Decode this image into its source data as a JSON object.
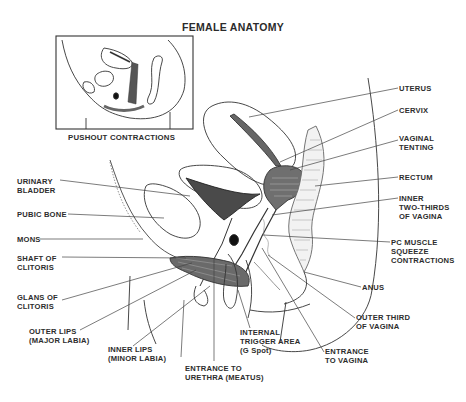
{
  "title": "FEMALE ANATOMY",
  "inset": {
    "caption": "PUSHOUT CONTRACTIONS"
  },
  "labels": {
    "right": [
      {
        "id": "uterus",
        "lines": [
          "UTERUS"
        ]
      },
      {
        "id": "cervix",
        "lines": [
          "CERVIX"
        ]
      },
      {
        "id": "vaginal-tenting",
        "lines": [
          "VAGINAL",
          "TENTING"
        ]
      },
      {
        "id": "rectum",
        "lines": [
          "RECTUM"
        ]
      },
      {
        "id": "inner-two-thirds",
        "lines": [
          "INNER",
          "TWO-THIRDS",
          "OF VAGINA"
        ]
      },
      {
        "id": "pc-muscle",
        "lines": [
          "PC MUSCLE",
          "SQUEEZE",
          "CONTRACTIONS"
        ]
      },
      {
        "id": "anus",
        "lines": [
          "ANUS"
        ]
      },
      {
        "id": "outer-third",
        "lines": [
          "OUTER THIRD",
          "OF VAGINA"
        ]
      },
      {
        "id": "entrance-vagina",
        "lines": [
          "ENTRANCE",
          "TO VAGINA"
        ]
      }
    ],
    "left": [
      {
        "id": "urinary-bladder",
        "lines": [
          "URINARY",
          "BLADDER"
        ]
      },
      {
        "id": "pubic-bone",
        "lines": [
          "PUBIC BONE"
        ]
      },
      {
        "id": "mons",
        "lines": [
          "MONS"
        ]
      },
      {
        "id": "shaft-clitoris",
        "lines": [
          "SHAFT OF",
          "CLITORIS"
        ]
      },
      {
        "id": "glans-clitoris",
        "lines": [
          "GLANS OF",
          "CLITORIS"
        ]
      },
      {
        "id": "outer-lips",
        "lines": [
          "OUTER LIPS",
          "(MAJOR LABIA)"
        ]
      },
      {
        "id": "inner-lips",
        "lines": [
          "INNER LIPS",
          "(MINOR LABIA)"
        ]
      }
    ],
    "bottom": [
      {
        "id": "g-spot",
        "lines": [
          "INTERNAL",
          "TRIGGER AREA",
          "(G Spot)"
        ]
      },
      {
        "id": "urethra",
        "lines": [
          "ENTRANCE TO",
          "URETHRA (MEATUS)"
        ]
      }
    ]
  },
  "colors": {
    "ink": "#2d2d2d",
    "shade": "#5a5a5a",
    "background": "#ffffff"
  }
}
